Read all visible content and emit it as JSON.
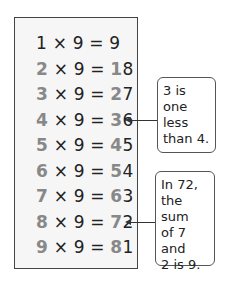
{
  "table": {
    "rows": [
      {
        "a_lead": "",
        "a_rest": "1",
        "op": " × 9 = ",
        "p_lead": "",
        "p_rest": "9"
      },
      {
        "a_lead": "2",
        "a_rest": "",
        "op": " × 9 = ",
        "p_lead": "1",
        "p_rest": "8"
      },
      {
        "a_lead": "3",
        "a_rest": "",
        "op": " × 9 = ",
        "p_lead": "2",
        "p_rest": "7"
      },
      {
        "a_lead": "4",
        "a_rest": "",
        "op": " × 9 = ",
        "p_lead": "3",
        "p_rest": "6"
      },
      {
        "a_lead": "5",
        "a_rest": "",
        "op": " × 9 = ",
        "p_lead": "4",
        "p_rest": "5"
      },
      {
        "a_lead": "6",
        "a_rest": "",
        "op": " × 9 = ",
        "p_lead": "5",
        "p_rest": "4"
      },
      {
        "a_lead": "7",
        "a_rest": "",
        "op": " × 9 = ",
        "p_lead": "6",
        "p_rest": "3"
      },
      {
        "a_lead": "8",
        "a_rest": "",
        "op": " × 9 = ",
        "p_lead": "7",
        "p_rest": "2"
      },
      {
        "a_lead": "9",
        "a_rest": "",
        "op": " × 9 = ",
        "p_lead": "8",
        "p_rest": "1"
      }
    ]
  },
  "notes": {
    "note1": {
      "lines": [
        "3 is one",
        "less",
        "than 4."
      ]
    },
    "note2": {
      "lines": [
        "In 72,",
        "the sum",
        "of 7 and",
        "2 is 9."
      ]
    }
  },
  "colors": {
    "highlight_digit": "#888888",
    "text": "#222222"
  }
}
